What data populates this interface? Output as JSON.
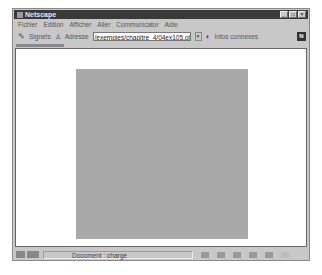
{
  "window": {
    "title": "Netscape",
    "controls": [
      "_",
      "□",
      "×"
    ]
  },
  "menubar": {
    "items": [
      "Fichier",
      "Edition",
      "Afficher",
      "Aller",
      "Communicator",
      "Aide"
    ]
  },
  "location_bar": {
    "bookmarks_label": "Signets",
    "address_label": "Adresse",
    "url_value": "/exemples/chapitre_4/04ex105.php3",
    "related_label": "Infos connexes",
    "logo": "N"
  },
  "content": {
    "square_color": "#a9a9a9"
  },
  "statusbar": {
    "text": "Document : chargé"
  }
}
